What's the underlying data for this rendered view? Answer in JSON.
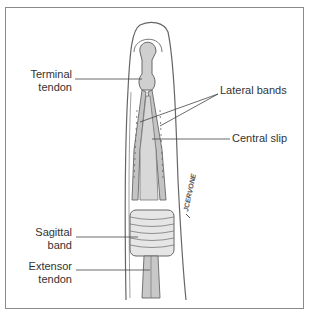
{
  "figure": {
    "signature": "JCERVONE",
    "labels": {
      "terminal_tendon": [
        "Terminal",
        "tendon"
      ],
      "lateral_bands": "Lateral bands",
      "central_slip": "Central slip",
      "sagittal_band": [
        "Sagittal",
        "band"
      ],
      "extensor_tendon": [
        "Extensor",
        "tendon"
      ]
    },
    "colors": {
      "frame": "#8a8a8a",
      "outline": "#555555",
      "tendon_fill": "#c8c8c8",
      "label_text": "#333333",
      "leader_line": "#444444"
    }
  }
}
